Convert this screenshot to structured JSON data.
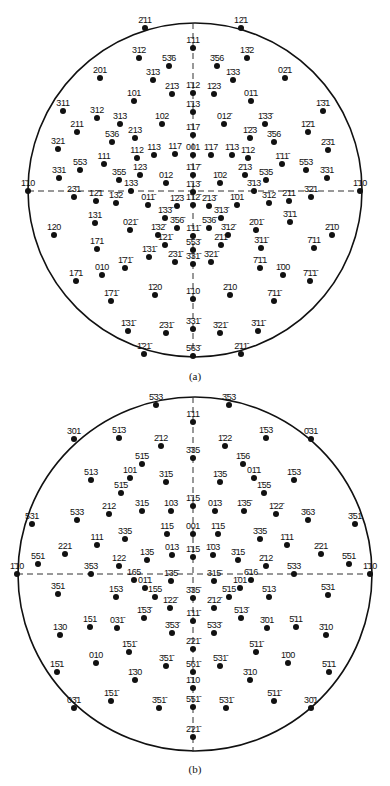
{
  "figures": [
    {
      "id": "a",
      "caption": "(a)",
      "top": 0,
      "circle": {
        "cx": 195,
        "cy": 190,
        "r": 167
      },
      "poles": [
        {
          "label": "2̄11",
          "x": 145,
          "y": 28
        },
        {
          "label": "12̄1",
          "x": 241,
          "y": 28
        },
        {
          "label": "1̄11",
          "x": 193,
          "y": 48
        },
        {
          "label": "31̄2",
          "x": 139,
          "y": 58
        },
        {
          "label": "53̄6",
          "x": 169,
          "y": 66
        },
        {
          "label": "3̄56",
          "x": 217,
          "y": 66
        },
        {
          "label": "13̄2",
          "x": 247,
          "y": 58
        },
        {
          "label": "201",
          "x": 100,
          "y": 78
        },
        {
          "label": "31̄3",
          "x": 153,
          "y": 80
        },
        {
          "label": "1̄33",
          "x": 233,
          "y": 80
        },
        {
          "label": "02̄1",
          "x": 285,
          "y": 78
        },
        {
          "label": "101",
          "x": 134,
          "y": 101
        },
        {
          "label": "21̄3",
          "x": 172,
          "y": 94
        },
        {
          "label": "1̄12",
          "x": 193,
          "y": 93
        },
        {
          "label": "1̄23",
          "x": 214,
          "y": 94
        },
        {
          "label": "01̄1",
          "x": 251,
          "y": 101
        },
        {
          "label": "311",
          "x": 63,
          "y": 111
        },
        {
          "label": "312",
          "x": 97,
          "y": 118
        },
        {
          "label": "313",
          "x": 120,
          "y": 124
        },
        {
          "label": "102",
          "x": 162,
          "y": 124
        },
        {
          "label": "1̄13",
          "x": 193,
          "y": 112
        },
        {
          "label": "012̄",
          "x": 224,
          "y": 124
        },
        {
          "label": "1̄33̄",
          "x": 265,
          "y": 124
        },
        {
          "label": "1̄3̄1",
          "x": 323,
          "y": 111
        },
        {
          "label": "211",
          "x": 77,
          "y": 132
        },
        {
          "label": "536",
          "x": 112,
          "y": 142
        },
        {
          "label": "213",
          "x": 135,
          "y": 138
        },
        {
          "label": "1̄17",
          "x": 193,
          "y": 135
        },
        {
          "label": "1̄2̄3",
          "x": 250,
          "y": 138
        },
        {
          "label": "3̄56",
          "x": 274,
          "y": 142
        },
        {
          "label": "1̄2̄1",
          "x": 308,
          "y": 132
        },
        {
          "label": "321",
          "x": 58,
          "y": 149
        },
        {
          "label": "112",
          "x": 137,
          "y": 158
        },
        {
          "label": "113",
          "x": 154,
          "y": 155
        },
        {
          "label": "117",
          "x": 175,
          "y": 154
        },
        {
          "label": "001",
          "x": 193,
          "y": 155
        },
        {
          "label": "1̄17",
          "x": 211,
          "y": 155
        },
        {
          "label": "1̄13",
          "x": 232,
          "y": 155
        },
        {
          "label": "1̄12",
          "x": 248,
          "y": 158
        },
        {
          "label": "2̄3̄1",
          "x": 328,
          "y": 150
        },
        {
          "label": "111",
          "x": 104,
          "y": 164
        },
        {
          "label": "553",
          "x": 80,
          "y": 170
        },
        {
          "label": "1̄11̄",
          "x": 282,
          "y": 164
        },
        {
          "label": "5̄53",
          "x": 306,
          "y": 170
        },
        {
          "label": "331",
          "x": 59,
          "y": 178
        },
        {
          "label": "355",
          "x": 119,
          "y": 180
        },
        {
          "label": "123",
          "x": 140,
          "y": 175
        },
        {
          "label": "012",
          "x": 166,
          "y": 183
        },
        {
          "label": "1̄17̄",
          "x": 193,
          "y": 175
        },
        {
          "label": "1̄02",
          "x": 220,
          "y": 183
        },
        {
          "label": "2̄13",
          "x": 245,
          "y": 175
        },
        {
          "label": "5̄35",
          "x": 266,
          "y": 180
        },
        {
          "label": "3̄31",
          "x": 327,
          "y": 178
        },
        {
          "label": "1̄10",
          "x": 28,
          "y": 191
        },
        {
          "label": "133",
          "x": 131,
          "y": 191
        },
        {
          "label": "1̄13̄",
          "x": 193,
          "y": 192
        },
        {
          "label": "3̄13",
          "x": 254,
          "y": 191
        },
        {
          "label": "1̄10",
          "x": 360,
          "y": 191
        },
        {
          "label": "23̄1",
          "x": 74,
          "y": 197
        },
        {
          "label": "12̄1",
          "x": 96,
          "y": 201
        },
        {
          "label": "13̄2",
          "x": 116,
          "y": 203
        },
        {
          "label": "011̄",
          "x": 148,
          "y": 205
        },
        {
          "label": "1̄2̄3",
          "x": 177,
          "y": 206
        },
        {
          "label": "1̄12̄",
          "x": 193,
          "y": 205
        },
        {
          "label": "2̄13̄",
          "x": 209,
          "y": 206
        },
        {
          "label": "1̄01",
          "x": 237,
          "y": 205
        },
        {
          "label": "3̄12",
          "x": 269,
          "y": 203
        },
        {
          "label": "2̄11",
          "x": 289,
          "y": 201
        },
        {
          "label": "3̄2̄1",
          "x": 311,
          "y": 197
        },
        {
          "label": "131",
          "x": 95,
          "y": 223
        },
        {
          "label": "1̄33̄",
          "x": 165,
          "y": 218
        },
        {
          "label": "3̄13̄",
          "x": 221,
          "y": 218
        },
        {
          "label": "3̄1̄1",
          "x": 290,
          "y": 222
        },
        {
          "label": "120",
          "x": 54,
          "y": 235
        },
        {
          "label": "021̄",
          "x": 130,
          "y": 230
        },
        {
          "label": "1̄32̄",
          "x": 158,
          "y": 235
        },
        {
          "label": "3̄56̄",
          "x": 177,
          "y": 228
        },
        {
          "label": "1̄11̄",
          "x": 193,
          "y": 236
        },
        {
          "label": "5̄36̄",
          "x": 209,
          "y": 228
        },
        {
          "label": "3̄12̄",
          "x": 228,
          "y": 235
        },
        {
          "label": "2̄01̄",
          "x": 256,
          "y": 230
        },
        {
          "label": "2̄1̄0",
          "x": 332,
          "y": 235
        },
        {
          "label": "171",
          "x": 97,
          "y": 249
        },
        {
          "label": "1̄21̄",
          "x": 165,
          "y": 245
        },
        {
          "label": "5̄53̄",
          "x": 193,
          "y": 250
        },
        {
          "label": "2̄11̄",
          "x": 221,
          "y": 245
        },
        {
          "label": "3̄11̄",
          "x": 261,
          "y": 248
        },
        {
          "label": "7̄11",
          "x": 314,
          "y": 248
        },
        {
          "label": "1̄31̄",
          "x": 149,
          "y": 257
        },
        {
          "label": "2̄31̄",
          "x": 175,
          "y": 262
        },
        {
          "label": "3̄31̄",
          "x": 193,
          "y": 264
        },
        {
          "label": "3̄21̄",
          "x": 211,
          "y": 262
        },
        {
          "label": "17̄1",
          "x": 76,
          "y": 281
        },
        {
          "label": "010",
          "x": 102,
          "y": 275
        },
        {
          "label": "1̄71̄",
          "x": 125,
          "y": 268
        },
        {
          "label": "7̄1̄1",
          "x": 260,
          "y": 268
        },
        {
          "label": "1̄00",
          "x": 283,
          "y": 275
        },
        {
          "label": "7̄1̄1̄",
          "x": 310,
          "y": 281
        },
        {
          "label": "1̄71̄",
          "x": 111,
          "y": 301
        },
        {
          "label": "1̄20",
          "x": 155,
          "y": 295
        },
        {
          "label": "1̄10",
          "x": 193,
          "y": 299
        },
        {
          "label": "2̄10",
          "x": 230,
          "y": 295
        },
        {
          "label": "7̄11̄",
          "x": 274,
          "y": 301
        },
        {
          "label": "1̄31̄",
          "x": 128,
          "y": 331
        },
        {
          "label": "2̄31̄",
          "x": 166,
          "y": 333
        },
        {
          "label": "3̄31̄",
          "x": 193,
          "y": 329
        },
        {
          "label": "3̄21̄",
          "x": 220,
          "y": 333
        },
        {
          "label": "3̄11̄",
          "x": 258,
          "y": 331
        },
        {
          "label": "1̄21̄",
          "x": 144,
          "y": 354
        },
        {
          "label": "5̄63̄",
          "x": 193,
          "y": 356
        },
        {
          "label": "2̄11̄",
          "x": 241,
          "y": 354
        }
      ]
    },
    {
      "id": "b",
      "caption": "(b)",
      "top": 0,
      "circle": {
        "cx": 195,
        "cy": 574,
        "r": 177
      },
      "poles": [
        {
          "label": "5̄33",
          "x": 156,
          "y": 405
        },
        {
          "label": "3̄53",
          "x": 229,
          "y": 405
        },
        {
          "label": "1̄11",
          "x": 193,
          "y": 422
        },
        {
          "label": "301",
          "x": 74,
          "y": 439
        },
        {
          "label": "51̄3",
          "x": 119,
          "y": 438
        },
        {
          "label": "2̄12",
          "x": 161,
          "y": 446
        },
        {
          "label": "1̄22",
          "x": 225,
          "y": 446
        },
        {
          "label": "1̄53",
          "x": 266,
          "y": 438
        },
        {
          "label": "0̄31",
          "x": 311,
          "y": 439
        },
        {
          "label": "3̄35",
          "x": 193,
          "y": 458
        },
        {
          "label": "51̄5",
          "x": 142,
          "y": 464
        },
        {
          "label": "1̄56",
          "x": 243,
          "y": 464
        },
        {
          "label": "513",
          "x": 91,
          "y": 480
        },
        {
          "label": "101",
          "x": 130,
          "y": 478
        },
        {
          "label": "31̄5",
          "x": 166,
          "y": 482
        },
        {
          "label": "1̄35",
          "x": 220,
          "y": 482
        },
        {
          "label": "01̄1",
          "x": 254,
          "y": 478
        },
        {
          "label": "1̄53",
          "x": 294,
          "y": 480
        },
        {
          "label": "51̄5",
          "x": 121,
          "y": 493
        },
        {
          "label": "1̄55",
          "x": 264,
          "y": 493
        },
        {
          "label": "531",
          "x": 32,
          "y": 524
        },
        {
          "label": "533",
          "x": 77,
          "y": 520
        },
        {
          "label": "212",
          "x": 109,
          "y": 514
        },
        {
          "label": "315",
          "x": 142,
          "y": 511
        },
        {
          "label": "103",
          "x": 171,
          "y": 511
        },
        {
          "label": "1̄15",
          "x": 193,
          "y": 506
        },
        {
          "label": "01̄3",
          "x": 215,
          "y": 511
        },
        {
          "label": "1̄35̄",
          "x": 244,
          "y": 511
        },
        {
          "label": "1̄22̄",
          "x": 276,
          "y": 514
        },
        {
          "label": "3̄63",
          "x": 308,
          "y": 520
        },
        {
          "label": "3̄51",
          "x": 355,
          "y": 524
        },
        {
          "label": "335",
          "x": 125,
          "y": 539
        },
        {
          "label": "115",
          "x": 167,
          "y": 534
        },
        {
          "label": "001",
          "x": 193,
          "y": 534
        },
        {
          "label": "1̄15",
          "x": 218,
          "y": 534
        },
        {
          "label": "3̄35",
          "x": 260,
          "y": 539
        },
        {
          "label": "111",
          "x": 97,
          "y": 545
        },
        {
          "label": "221",
          "x": 65,
          "y": 554
        },
        {
          "label": "1̄11",
          "x": 287,
          "y": 545
        },
        {
          "label": "2̄21",
          "x": 321,
          "y": 554
        },
        {
          "label": "551",
          "x": 38,
          "y": 564
        },
        {
          "label": "122",
          "x": 119,
          "y": 566
        },
        {
          "label": "135",
          "x": 147,
          "y": 560
        },
        {
          "label": "013",
          "x": 172,
          "y": 555
        },
        {
          "label": "1̄15",
          "x": 193,
          "y": 557
        },
        {
          "label": "1̄03",
          "x": 213,
          "y": 555
        },
        {
          "label": "3̄15",
          "x": 238,
          "y": 560
        },
        {
          "label": "2̄12",
          "x": 266,
          "y": 566
        },
        {
          "label": "5̄51",
          "x": 349,
          "y": 564
        },
        {
          "label": "1̄10",
          "x": 17,
          "y": 574
        },
        {
          "label": "353",
          "x": 91,
          "y": 574
        },
        {
          "label": "5̄33",
          "x": 294,
          "y": 574
        },
        {
          "label": "1̄10",
          "x": 370,
          "y": 574
        },
        {
          "label": "165",
          "x": 134,
          "y": 580
        },
        {
          "label": "01̄1",
          "x": 145,
          "y": 588
        },
        {
          "label": "1̄35̄",
          "x": 171,
          "y": 581
        },
        {
          "label": "315̄",
          "x": 214,
          "y": 581
        },
        {
          "label": "6̄16",
          "x": 251,
          "y": 580
        },
        {
          "label": "1̄01",
          "x": 240,
          "y": 588
        },
        {
          "label": "351",
          "x": 58,
          "y": 594
        },
        {
          "label": "155",
          "x": 155,
          "y": 597
        },
        {
          "label": "3̄35̄",
          "x": 193,
          "y": 598
        },
        {
          "label": "5̄15",
          "x": 229,
          "y": 597
        },
        {
          "label": "5̄13",
          "x": 269,
          "y": 597
        },
        {
          "label": "5̄31",
          "x": 328,
          "y": 595
        },
        {
          "label": "153",
          "x": 116,
          "y": 597
        },
        {
          "label": "1̄22̄",
          "x": 170,
          "y": 608
        },
        {
          "label": "2̄12̄",
          "x": 214,
          "y": 608
        },
        {
          "label": "1̄53̄",
          "x": 144,
          "y": 618
        },
        {
          "label": "1̄11̄",
          "x": 193,
          "y": 621
        },
        {
          "label": "5̄13̄",
          "x": 241,
          "y": 618
        },
        {
          "label": "3̄01",
          "x": 267,
          "y": 628
        },
        {
          "label": "5̄11",
          "x": 296,
          "y": 627
        },
        {
          "label": "151",
          "x": 90,
          "y": 627
        },
        {
          "label": "031̄",
          "x": 117,
          "y": 628
        },
        {
          "label": "130",
          "x": 60,
          "y": 635
        },
        {
          "label": "3̄10",
          "x": 326,
          "y": 635
        },
        {
          "label": "3̄53̄",
          "x": 172,
          "y": 633
        },
        {
          "label": "5̄33̄",
          "x": 214,
          "y": 633
        },
        {
          "label": "2̄21̄",
          "x": 193,
          "y": 649
        },
        {
          "label": "1̄51̄",
          "x": 129,
          "y": 652
        },
        {
          "label": "5̄11̄",
          "x": 256,
          "y": 652
        },
        {
          "label": "010",
          "x": 96,
          "y": 663
        },
        {
          "label": "1̄00",
          "x": 288,
          "y": 663
        },
        {
          "label": "3̄51̄",
          "x": 166,
          "y": 666
        },
        {
          "label": "5̄31̄",
          "x": 220,
          "y": 666
        },
        {
          "label": "15̄1",
          "x": 57,
          "y": 672
        },
        {
          "label": "5̄1̄1",
          "x": 329,
          "y": 672
        },
        {
          "label": "1̄30",
          "x": 135,
          "y": 680
        },
        {
          "label": "3̄10",
          "x": 250,
          "y": 680
        },
        {
          "label": "5̄61̄",
          "x": 193,
          "y": 672
        },
        {
          "label": "1̄10",
          "x": 193,
          "y": 688
        },
        {
          "label": "03̄1",
          "x": 74,
          "y": 708
        },
        {
          "label": "1̄51̄",
          "x": 111,
          "y": 701
        },
        {
          "label": "3̄51̄",
          "x": 159,
          "y": 708
        },
        {
          "label": "5̄51̄",
          "x": 193,
          "y": 707
        },
        {
          "label": "5̄31̄",
          "x": 226,
          "y": 708
        },
        {
          "label": "5̄11̄",
          "x": 274,
          "y": 701
        },
        {
          "label": "30̄1",
          "x": 311,
          "y": 708
        },
        {
          "label": "2̄21̄",
          "x": 193,
          "y": 737
        }
      ]
    }
  ],
  "captions": {
    "a": "(a)",
    "b": "(b)"
  }
}
